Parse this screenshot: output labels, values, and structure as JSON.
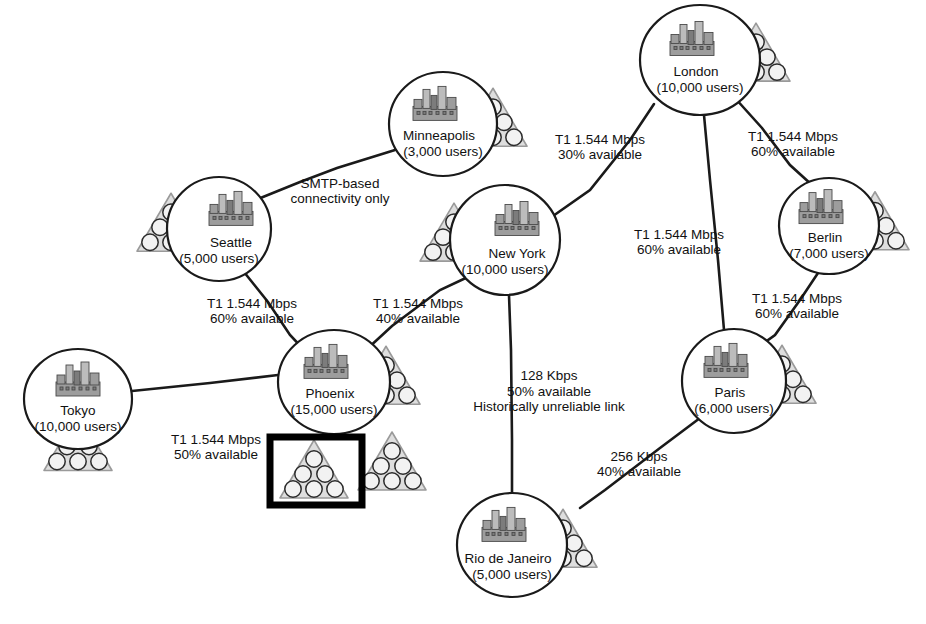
{
  "diagram": {
    "type": "network-topology",
    "background_color": "#ffffff",
    "line_color": "#1a1a1a",
    "triangle_fill": "#dedede",
    "highlight_color": "#000000"
  },
  "nodes": [
    {
      "id": "london",
      "name": "London",
      "users": "(10,000 users)",
      "cx": 700,
      "cy": 60,
      "rx": 60,
      "ry": 55,
      "icon_side": "right",
      "label_dy": 12
    },
    {
      "id": "minneapolis",
      "name": "Minneapolis",
      "users": "(3,000 users)",
      "cx": 443,
      "cy": 124,
      "rx": 54,
      "ry": 52,
      "icon_side": "right",
      "label_dy": 12
    },
    {
      "id": "seattle",
      "name": "Seattle",
      "users": "(5,000 users)",
      "cx": 219,
      "cy": 229,
      "rx": 52,
      "ry": 52,
      "icon_side": "left",
      "label_dy": 14
    },
    {
      "id": "newyork",
      "name": "New York",
      "users": "(10,000 users)",
      "cx": 505,
      "cy": 240,
      "rx": 55,
      "ry": 55,
      "icon_side": "left",
      "label_dy": 14
    },
    {
      "id": "berlin",
      "name": "Berlin",
      "users": "(7,000 users)",
      "cx": 829,
      "cy": 226,
      "rx": 50,
      "ry": 48,
      "icon_side": "right",
      "label_dy": 12
    },
    {
      "id": "phoenix",
      "name": "Phoenix",
      "users": "(15,000 users)",
      "cx": 334,
      "cy": 382,
      "rx": 56,
      "ry": 52,
      "icon_side": "right",
      "label_dy": 12
    },
    {
      "id": "tokyo",
      "name": "Tokyo",
      "users": "(10,000 users)",
      "cx": 78,
      "cy": 399,
      "rx": 54,
      "ry": 50,
      "icon_side": "below",
      "label_dy": 12
    },
    {
      "id": "paris",
      "name": "Paris",
      "users": "(6,000 users)",
      "cx": 734,
      "cy": 381,
      "rx": 52,
      "ry": 52,
      "icon_side": "right",
      "label_dy": 12
    },
    {
      "id": "rio",
      "name": "Rio de Janeiro",
      "users": "(5,000 users)",
      "cx": 512,
      "cy": 545,
      "rx": 55,
      "ry": 52,
      "icon_side": "right",
      "label_dy": 14
    }
  ],
  "edges": [
    {
      "id": "seattle-minneapolis",
      "from": "seattle",
      "to": "minneapolis",
      "points": "258,199 300,182 337,168 395,150",
      "label_lines": [
        "SMTP-based",
        "connectivity only"
      ],
      "label_x": 340,
      "label_y": 192
    },
    {
      "id": "seattle-phoenix",
      "from": "seattle",
      "to": "phoenix",
      "points": "244,272 268,302 290,335 306,352",
      "label_lines": [
        "T1 1.544 Mbps",
        "60% available"
      ],
      "label_x": 252,
      "label_y": 312
    },
    {
      "id": "phoenix-newyork",
      "from": "phoenix",
      "to": "newyork",
      "points": "366,350 392,326 440,290 470,276",
      "label_lines": [
        "T1 1.544 Mbps",
        "40% available"
      ],
      "label_x": 418,
      "label_y": 312
    },
    {
      "id": "tokyo-phoenix",
      "from": "tokyo",
      "to": "phoenix",
      "points": "132,391 210,383 278,375",
      "label_lines": [
        "T1 1.544 Mbps",
        "50% available"
      ],
      "label_x": 216,
      "label_y": 448
    },
    {
      "id": "newyork-london",
      "from": "newyork",
      "to": "london",
      "points": "553,216 590,190 630,140 654,104",
      "label_lines": [
        "T1 1.544 Mbps",
        "30% available"
      ],
      "label_x": 600,
      "label_y": 148
    },
    {
      "id": "london-berlin",
      "from": "london",
      "to": "berlin",
      "points": "735,98 762,128 790,165 812,185",
      "label_lines": [
        "T1 1.544 Mbps",
        "60% available"
      ],
      "label_x": 793,
      "label_y": 145
    },
    {
      "id": "london-paris",
      "from": "london",
      "to": "paris",
      "points": "704,115 710,180 718,260 724,330",
      "label_lines": [
        "T1 1.544 Mbps",
        "60% available"
      ],
      "label_x": 679,
      "label_y": 243
    },
    {
      "id": "berlin-paris",
      "from": "berlin",
      "to": "paris",
      "points": "818,273 800,300 775,335 757,348",
      "label_lines": [
        "T1 1.544 Mbps",
        "60% available"
      ],
      "label_x": 797,
      "label_y": 307
    },
    {
      "id": "newyork-rio",
      "from": "newyork",
      "to": "rio",
      "points": "509,295 511,350 512,440 512,494",
      "label_lines": [
        "128 Kbps",
        "50% available",
        "Historically unreliable link"
      ],
      "label_x": 549,
      "label_y": 392
    },
    {
      "id": "paris-rio",
      "from": "paris",
      "to": "rio",
      "points": "700,418 660,448 605,490 580,508",
      "label_lines": [
        "256 Kbps",
        "40% available"
      ],
      "label_x": 639,
      "label_y": 465
    }
  ],
  "standalone_triangles": [
    {
      "id": "phoenix-tri-highlighted",
      "cx": 314,
      "cy": 470,
      "size": 30,
      "highlighted": true
    },
    {
      "id": "phoenix-tri-secondary",
      "cx": 392,
      "cy": 462,
      "size": 30,
      "highlighted": false
    }
  ],
  "highlight": {
    "id": "phoenix-selection-box",
    "x": 270,
    "y": 437,
    "width": 92,
    "height": 68,
    "stroke": "#000000",
    "note": "selection rectangle around one Phoenix server-group triangle"
  }
}
